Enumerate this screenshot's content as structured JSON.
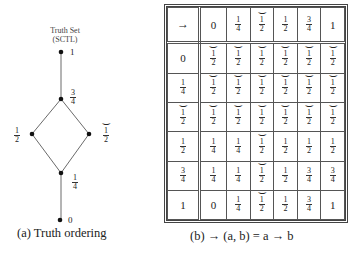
{
  "panel_a": {
    "title_line1": "Truth Set",
    "title_line2": "(SCTL)",
    "caption": "(a) Truth ordering",
    "nodes": [
      {
        "label": "1",
        "x": 61,
        "y": 52
      },
      {
        "label": "3/4",
        "x": 61,
        "y": 99,
        "hat": false
      },
      {
        "label": "1/2",
        "x": 32,
        "y": 134,
        "hat": false
      },
      {
        "label": "1/2",
        "x": 89,
        "y": 134,
        "hat": true
      },
      {
        "label": "1/4",
        "x": 61,
        "y": 173,
        "hat": false
      },
      {
        "label": "0",
        "x": 61,
        "y": 220
      }
    ]
  },
  "panel_b": {
    "caption": "(b) → (a, b) = a → b",
    "corner": "→",
    "columns": [
      "0",
      "1/4",
      "^1/2",
      "1/2",
      "3/4",
      "1"
    ],
    "rows": [
      {
        "head": "0",
        "cells": [
          "^1/2",
          "^1/2",
          "^1/2",
          "^1/2",
          "^1/2",
          "^1/2"
        ]
      },
      {
        "head": "1/4",
        "cells": [
          "^1/2",
          "^1/2",
          "^1/2",
          "^1/2",
          "^1/2",
          "^1/2"
        ]
      },
      {
        "head": "^1/2",
        "cells": [
          "^1/2",
          "^1/2",
          "^1/2",
          "^1/2",
          "^1/2",
          "^1/2"
        ]
      },
      {
        "head": "1/2",
        "cells": [
          "1/4",
          "1/4",
          "^1/2",
          "1/2",
          "1/2",
          "1/2"
        ]
      },
      {
        "head": "3/4",
        "cells": [
          "1/4",
          "1/4",
          "^1/2",
          "1/2",
          "3/4",
          "3/4"
        ]
      },
      {
        "head": "1",
        "cells": [
          "0",
          "1/4",
          "^1/2",
          "1/2",
          "3/4",
          "1"
        ]
      }
    ]
  }
}
